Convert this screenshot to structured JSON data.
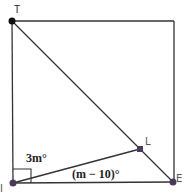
{
  "diagram": {
    "type": "square with diagonal and interior segment",
    "vertices": {
      "T": {
        "label": "T",
        "x": 12,
        "y": 21
      },
      "I": {
        "label": "I",
        "x": 13,
        "y": 183
      },
      "E": {
        "label": "E",
        "x": 173,
        "y": 182
      },
      "L": {
        "label": "L",
        "x": 140,
        "y": 149
      }
    },
    "angles": {
      "upper": {
        "label": "3m°",
        "at": "I",
        "between": [
          "IT",
          "IL"
        ]
      },
      "lower": {
        "label": "(m − 10)°",
        "at": "I",
        "between": [
          "IL",
          "IE"
        ]
      },
      "right_angle_marker": {
        "at": "I"
      }
    },
    "segments": [
      "TE",
      "IL",
      "TI",
      "IE",
      "top edge",
      "right edge"
    ],
    "colors": {
      "line": "#333333",
      "point_T": "#111111",
      "point_other": "#4a3a5a"
    }
  }
}
